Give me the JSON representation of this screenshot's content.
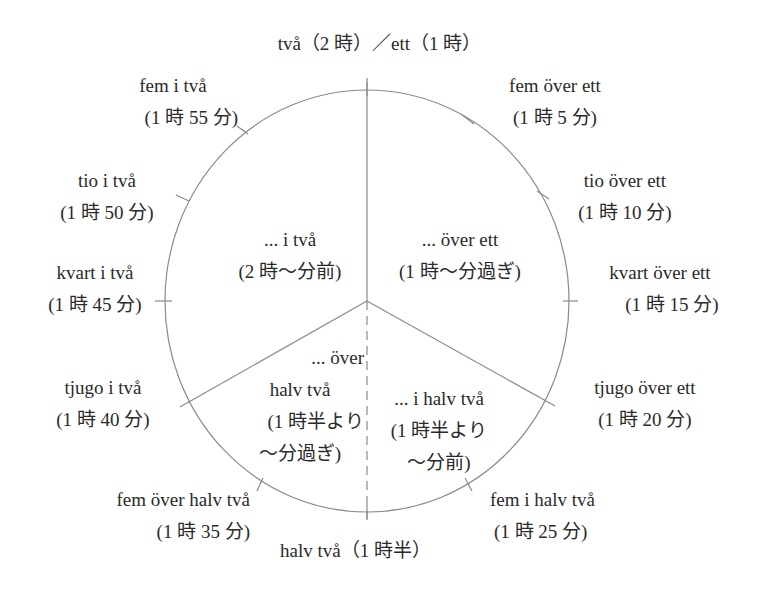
{
  "top_label": "två（2 時）／ett（1 時）",
  "bottom_label": "halv två（1 時半）",
  "colors": {
    "line": "#8a8a8a",
    "text": "#2a2a2a",
    "background": "#ffffff"
  },
  "sectors": {
    "upper_left": {
      "line1": "... i två",
      "line2": "(2 時〜分前)"
    },
    "upper_right": {
      "line1": "... över ett",
      "line2": "(1 時〜分過ぎ)"
    },
    "lower_left": {
      "line1": "... över",
      "line2": "halv två",
      "line3": "(1 時半より",
      "line4": "〜分過ぎ)"
    },
    "lower_right": {
      "line1": "... i halv två",
      "line2": "(1 時半より",
      "line3": "〜分前)"
    }
  },
  "ticks": [
    {
      "minute": 5,
      "sv": "fem över ett",
      "ja": "(1 時 5 分)"
    },
    {
      "minute": 10,
      "sv": "tio över ett",
      "ja": "(1 時 10 分)"
    },
    {
      "minute": 15,
      "sv": "kvart över ett",
      "ja": "(1 時 15 分)"
    },
    {
      "minute": 20,
      "sv": "tjugo över ett",
      "ja": "(1 時 20 分)"
    },
    {
      "minute": 25,
      "sv": "fem i halv två",
      "ja": "(1 時 25 分)"
    },
    {
      "minute": 35,
      "sv": "fem över halv två",
      "ja": "(1 時 35 分)"
    },
    {
      "minute": 40,
      "sv": "tjugo i två",
      "ja": "(1 時 40 分)"
    },
    {
      "minute": 45,
      "sv": "kvart i två",
      "ja": "(1 時 45 分)"
    },
    {
      "minute": 50,
      "sv": "tio i två",
      "ja": "(1 時 50 分)"
    },
    {
      "minute": 55,
      "sv": "fem i två",
      "ja": "(1 時 55 分)"
    }
  ]
}
